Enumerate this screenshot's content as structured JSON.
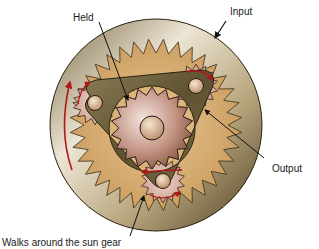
{
  "labels": {
    "held": "Held",
    "input": "Input",
    "output": "Output",
    "walks": "Walks around the sun gear"
  },
  "components": {
    "ring_gear": {
      "role": "Input",
      "teeth_outer_visible": false
    },
    "sun_gear": {
      "role": "Held"
    },
    "carrier": {
      "role": "Output",
      "pins": 3
    },
    "planet_pinions": {
      "count": 3,
      "motion": "Walks around the sun gear"
    }
  },
  "colors": {
    "ring_dark": "#5a4a2a",
    "ring_light": "#e8e0d0",
    "gear_tan": "#d4a868",
    "carrier": "#6b5e3a",
    "sun_copper": "#b07860",
    "arrow_red": "#b01818",
    "leader_black": "#111111"
  }
}
